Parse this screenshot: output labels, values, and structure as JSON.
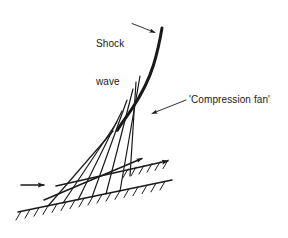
{
  "figure": {
    "width": 288,
    "height": 238,
    "background_color": "#ffffff",
    "line_color": "#1a1a1a"
  },
  "labels": {
    "shock_wave": "Shock\nwave",
    "shock_wave_line1": "Shock",
    "shock_wave_line2": "wave",
    "compression_fan": "'Compression fan'"
  },
  "annotations": [
    {
      "name": "shock-wave-leader",
      "label": "Shock wave",
      "from": [
        133,
        24
      ],
      "to": [
        157,
        33
      ],
      "arrow_at": "to"
    },
    {
      "name": "compression-fan-leader",
      "label": "'Compression fan'",
      "from": [
        186,
        100
      ],
      "to": [
        149,
        114
      ],
      "arrow_at": "to"
    }
  ],
  "geometry": {
    "shock_wave": {
      "name": "shock-wave-curve",
      "description": "Thick curved oblique shock, steep at top, bending left and thinning downward",
      "points": [
        [
          162,
          28
        ],
        [
          158,
          52
        ],
        [
          151,
          73
        ],
        [
          141,
          93
        ],
        [
          129,
          112
        ],
        [
          119,
          128
        ]
      ],
      "stroke_width_top": 2.6,
      "stroke_width_bottom": 1.1
    },
    "lower_wall": {
      "name": "lower-wall",
      "start": [
        18,
        212
      ],
      "end": [
        172,
        180
      ],
      "hatch_side": "below",
      "hatch_count": 17
    },
    "upper_wall": {
      "name": "upper-wall-streamline",
      "start": [
        56,
        186
      ],
      "end": [
        172,
        160
      ],
      "hatch_side": "below",
      "hatch_count": 8,
      "arrow_at_end": true
    },
    "middle_streamline": {
      "name": "middle-streamline",
      "start": [
        44,
        200
      ],
      "end": [
        146,
        157
      ],
      "arrow_at_end": true
    },
    "inflow_arrow": {
      "name": "inflow-arrow",
      "start": [
        21,
        185
      ],
      "end": [
        47,
        185
      ]
    },
    "fan_lines": {
      "name": "compression-fan-lines",
      "count": 6,
      "origins": [
        [
          48,
          206
        ],
        [
          63,
          203
        ],
        [
          78,
          200
        ],
        [
          92,
          197
        ],
        [
          106,
          194
        ],
        [
          120,
          191
        ]
      ],
      "convergence": [
        [
          113,
          131
        ],
        [
          117,
          122
        ],
        [
          122,
          111
        ],
        [
          127,
          100
        ],
        [
          133,
          89
        ],
        [
          140,
          76
        ]
      ]
    },
    "vertical_characteristic": {
      "name": "rear-characteristic-line",
      "start": [
        135,
        85
      ],
      "end": [
        130,
        175
      ]
    }
  },
  "colors": {
    "ink": "#1a1a1a",
    "paper": "#ffffff"
  }
}
